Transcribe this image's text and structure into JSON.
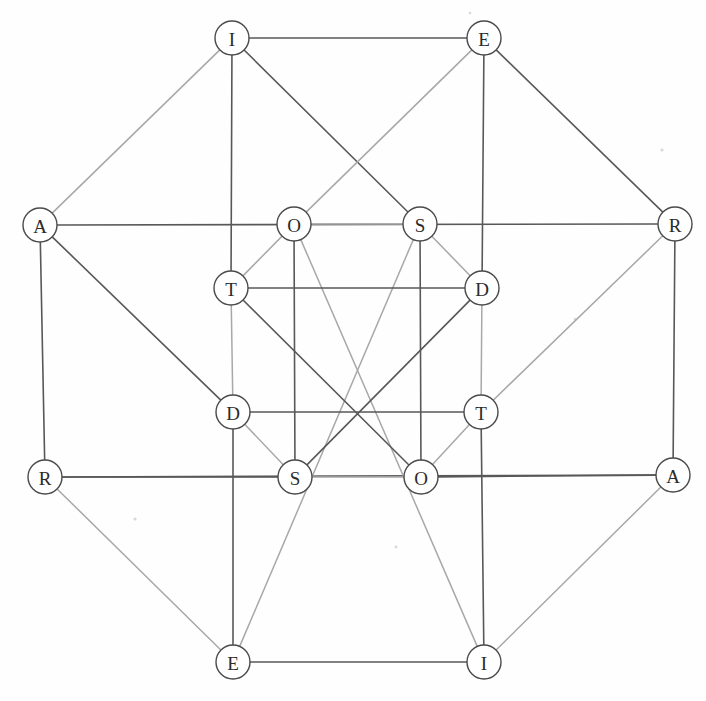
{
  "figure": {
    "name": "hypercube-graph",
    "background_color": "#fefefe",
    "node_fill": "#ffffff",
    "node_stroke": "#4a4a4a",
    "edge_dark_color": "#585858",
    "edge_light_color": "#a8a8a8",
    "node_radius": 17,
    "width": 706,
    "height": 701
  },
  "nodes": [
    {
      "id": "n0",
      "label": "I",
      "x": 232,
      "y": 38,
      "ring": "outer"
    },
    {
      "id": "n1",
      "label": "E",
      "x": 484,
      "y": 38,
      "ring": "outer"
    },
    {
      "id": "n2",
      "label": "A",
      "x": 40,
      "y": 225,
      "ring": "outer"
    },
    {
      "id": "n3",
      "label": "R",
      "x": 675,
      "y": 224,
      "ring": "outer"
    },
    {
      "id": "n4",
      "label": "R",
      "x": 45,
      "y": 477,
      "ring": "outer"
    },
    {
      "id": "n5",
      "label": "A",
      "x": 673,
      "y": 475,
      "ring": "outer"
    },
    {
      "id": "n6",
      "label": "E",
      "x": 233,
      "y": 662,
      "ring": "outer"
    },
    {
      "id": "n7",
      "label": "I",
      "x": 484,
      "y": 662,
      "ring": "outer"
    },
    {
      "id": "n8",
      "label": "O",
      "x": 294,
      "y": 224,
      "ring": "inner"
    },
    {
      "id": "n9",
      "label": "S",
      "x": 420,
      "y": 224,
      "ring": "inner"
    },
    {
      "id": "n10",
      "label": "T",
      "x": 231,
      "y": 288,
      "ring": "inner"
    },
    {
      "id": "n11",
      "label": "D",
      "x": 482,
      "y": 288,
      "ring": "inner"
    },
    {
      "id": "n12",
      "label": "D",
      "x": 233,
      "y": 412,
      "ring": "inner"
    },
    {
      "id": "n13",
      "label": "T",
      "x": 481,
      "y": 412,
      "ring": "inner"
    },
    {
      "id": "n14",
      "label": "S",
      "x": 295,
      "y": 477,
      "ring": "inner"
    },
    {
      "id": "n15",
      "label": "O",
      "x": 421,
      "y": 477,
      "ring": "inner"
    }
  ],
  "edges": [
    {
      "from": "n0",
      "to": "n1",
      "style": "dark"
    },
    {
      "from": "n0",
      "to": "n2",
      "style": "light"
    },
    {
      "from": "n0",
      "to": "n10",
      "style": "dark"
    },
    {
      "from": "n0",
      "to": "n9",
      "style": "dark"
    },
    {
      "from": "n1",
      "to": "n3",
      "style": "dark"
    },
    {
      "from": "n1",
      "to": "n11",
      "style": "dark"
    },
    {
      "from": "n1",
      "to": "n8",
      "style": "light"
    },
    {
      "from": "n2",
      "to": "n3",
      "style": "dark"
    },
    {
      "from": "n2",
      "to": "n4",
      "style": "dark"
    },
    {
      "from": "n2",
      "to": "n12",
      "style": "dark"
    },
    {
      "from": "n3",
      "to": "n5",
      "style": "dark"
    },
    {
      "from": "n3",
      "to": "n13",
      "style": "light"
    },
    {
      "from": "n4",
      "to": "n6",
      "style": "light"
    },
    {
      "from": "n4",
      "to": "n5",
      "style": "dark"
    },
    {
      "from": "n4",
      "to": "n14",
      "style": "dark"
    },
    {
      "from": "n5",
      "to": "n7",
      "style": "light"
    },
    {
      "from": "n5",
      "to": "n15",
      "style": "dark"
    },
    {
      "from": "n6",
      "to": "n7",
      "style": "dark"
    },
    {
      "from": "n6",
      "to": "n9",
      "style": "light"
    },
    {
      "from": "n6",
      "to": "n12",
      "style": "dark"
    },
    {
      "from": "n7",
      "to": "n8",
      "style": "light"
    },
    {
      "from": "n7",
      "to": "n13",
      "style": "dark"
    },
    {
      "from": "n8",
      "to": "n9",
      "style": "light"
    },
    {
      "from": "n8",
      "to": "n10",
      "style": "light"
    },
    {
      "from": "n8",
      "to": "n14",
      "style": "dark"
    },
    {
      "from": "n9",
      "to": "n11",
      "style": "light"
    },
    {
      "from": "n9",
      "to": "n15",
      "style": "dark"
    },
    {
      "from": "n10",
      "to": "n11",
      "style": "dark"
    },
    {
      "from": "n10",
      "to": "n12",
      "style": "light"
    },
    {
      "from": "n10",
      "to": "n15",
      "style": "dark"
    },
    {
      "from": "n11",
      "to": "n13",
      "style": "light"
    },
    {
      "from": "n11",
      "to": "n14",
      "style": "dark"
    },
    {
      "from": "n12",
      "to": "n13",
      "style": "dark"
    },
    {
      "from": "n12",
      "to": "n14",
      "style": "light"
    },
    {
      "from": "n13",
      "to": "n15",
      "style": "light"
    },
    {
      "from": "n14",
      "to": "n15",
      "style": "light"
    }
  ],
  "specks": [
    {
      "x": 662,
      "y": 150,
      "r": 1.6
    },
    {
      "x": 135,
      "y": 519,
      "r": 1.6
    },
    {
      "x": 396,
      "y": 547,
      "r": 1.4
    },
    {
      "x": 575,
      "y": 319,
      "r": 1.3
    },
    {
      "x": 470,
      "y": 13,
      "r": 1.3
    }
  ]
}
